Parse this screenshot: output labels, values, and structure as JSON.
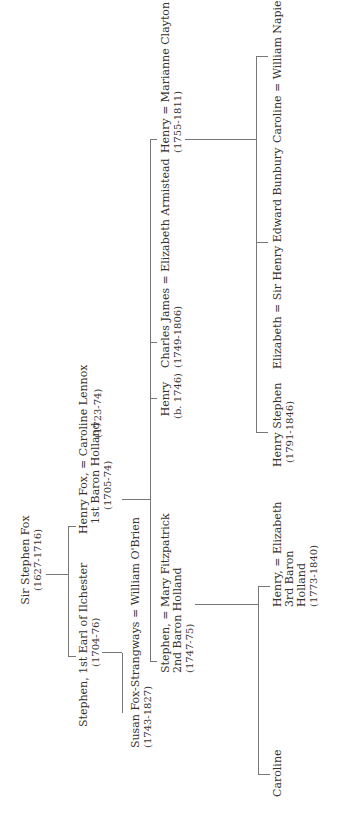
{
  "line_color": "#777777",
  "text_color": "#333333",
  "people": {
    "sir_stephen": {
      "name": "Sir Stephen Fox",
      "dates": "(1627-1716)"
    },
    "stephen_ilchester": {
      "name": "Stephen, 1st Earl of Ilchester",
      "dates": "(1704-76)"
    },
    "henry_fox": {
      "name": "Henry Fox, = Caroline Lennox",
      "line2": "1st Baron Holland",
      "dates": "(1705-74)",
      "spouse_dates": "(1723-74)"
    },
    "susan": {
      "name": "Susan Fox-Strangways = William O'Brien",
      "dates": "(1743-1827)"
    },
    "stephen_2nd": {
      "name": "Stephen, = Mary Fitzpatrick",
      "line2": "2nd Baron Holland",
      "dates": "(1747-75)"
    },
    "henry_b1746": {
      "name": "Henry",
      "dates": "(b. 1746)"
    },
    "charles_james": {
      "name": "Charles James = Elizabeth Armistead",
      "dates": "(1749-1806)"
    },
    "henry_marianne": {
      "name": "Henry = Marianne Clayton",
      "dates": "(1755-1811)"
    },
    "caroline_1": {
      "name": "Caroline"
    },
    "henry_3rd": {
      "name": "Henry, = Elizabeth",
      "line2": "3rd Baron",
      "line3": "Holland",
      "dates": "(1773-1840)"
    },
    "henry_stephen": {
      "name": "Henry Stephen",
      "dates": "(1791-1846)"
    },
    "elizabeth_bunbury": {
      "name": "Elizabeth = Sir Henry Edward Bunbury"
    },
    "caroline_napier": {
      "name": "Caroline = William  Napier"
    }
  }
}
